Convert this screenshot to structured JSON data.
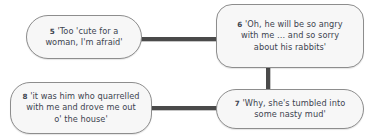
{
  "diagram": {
    "background_color": "#ffffff",
    "node_fill_color": "#f7f7f7",
    "node_border_color": "#8d8d8d",
    "connector_color": "#4a4a4a",
    "text_color": "#3d4450",
    "nodes": [
      {
        "id": "5",
        "label": "5",
        "text": "'Too 'cute for a\nwoman, I'm afraid'",
        "full_text": "5 'Too 'cute for a woman, I'm afraid'",
        "position": "top-left"
      },
      {
        "id": "6",
        "label": "6",
        "text": "'Oh, he will be so angry\nwith me … and so sorry\nabout his rabbits'",
        "full_text": "6 'Oh, he will be so angry with me … and so sorry about his rabbits'",
        "position": "top-right"
      },
      {
        "id": "7",
        "label": "7",
        "text": "'Why, she's tumbled into\nsome nasty mud'",
        "full_text": "7 'Why, she's tumbled into some nasty mud'",
        "position": "bottom-right"
      },
      {
        "id": "8",
        "label": "8",
        "text": "'it was him who quarrelled\nwith me and drove me out\no' the house'",
        "full_text": "8 'it was him who quarrelled with me and drove me out o' the house'",
        "position": "bottom-left"
      }
    ],
    "edges": [
      {
        "from": "5",
        "to": "6",
        "orientation": "horizontal"
      },
      {
        "from": "6",
        "to": "7",
        "orientation": "vertical"
      },
      {
        "from": "8",
        "to": "7",
        "orientation": "horizontal"
      }
    ]
  }
}
